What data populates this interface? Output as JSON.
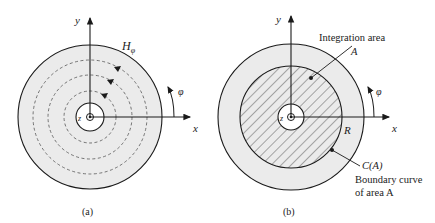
{
  "figure_a": {
    "caption": "(a)",
    "axis_x": "x",
    "axis_y": "y",
    "axis_z": "z",
    "field_label": "H",
    "field_sub": "φ",
    "angle_label": "φ"
  },
  "figure_b": {
    "caption": "(b)",
    "axis_x": "x",
    "axis_y": "y",
    "axis_z": "z",
    "angle_label": "φ",
    "radius_label": "R",
    "area_title": "Integration area",
    "area_symbol": "A",
    "curve_label": "C(A)",
    "curve_desc_1": "Boundary curve",
    "curve_desc_2": "of area A"
  },
  "colors": {
    "fill_gray": "#ebebeb",
    "stroke": "#1a1a1a",
    "hatch": "#333333"
  }
}
